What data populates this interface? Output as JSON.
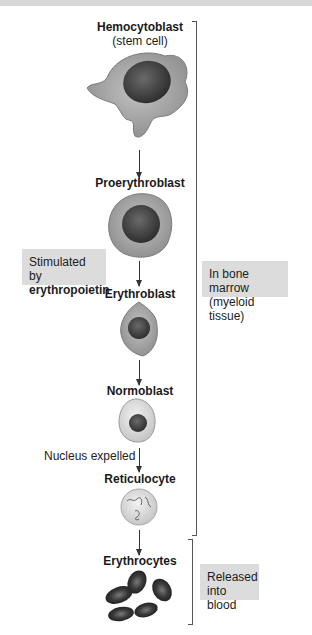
{
  "diagram": {
    "stages": [
      {
        "name": "Hemocytoblast",
        "subtitle": "(stem cell)"
      },
      {
        "name": "Proerythroblast"
      },
      {
        "name": "Erythroblast"
      },
      {
        "name": "Normoblast"
      },
      {
        "name": "Reticulocyte"
      },
      {
        "name": "Erythrocytes"
      }
    ],
    "annotations": {
      "stimulated_line1": "Stimulated by",
      "stimulated_line2": "erythropoietin",
      "nucleus_expelled": "Nucleus expelled"
    },
    "brackets": {
      "marrow_line1": "In bone marrow",
      "marrow_line2": "(myeloid tissue)",
      "blood_line1": "Released",
      "blood_line2": "into blood"
    },
    "colors": {
      "cell_cytoplasm": "#a8a8a8",
      "nucleus": "#3c3c3c",
      "label_box": "#dcdcdc"
    }
  }
}
